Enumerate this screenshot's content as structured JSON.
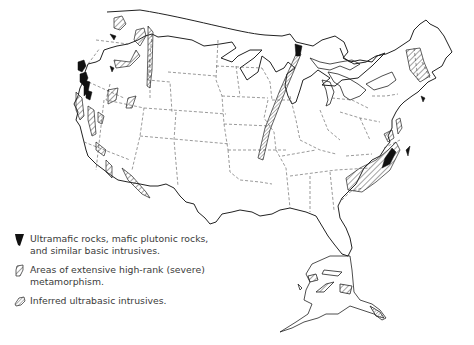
{
  "map": {
    "title": "Distribution of ultramafic rocks, high-rank metamorphism, and inferred ultrabasic intrusives in the United States",
    "region": "United States (conterminous) and Alaska",
    "colors": {
      "outline": "#222222",
      "state_border": "#555555",
      "solid_fill": "#111111",
      "hatch": "#333333",
      "background": "#ffffff"
    }
  },
  "legend": {
    "items": [
      {
        "symbol": "solid-black",
        "label": "Ultramafic rocks, mafic plutonic rocks, and similar basic intrusives."
      },
      {
        "symbol": "hatched-wide",
        "label": "Areas of extensive high-rank (severe) metamorphism."
      },
      {
        "symbol": "hatched-fine",
        "label": "Inferred ultrabasic intrusives."
      }
    ]
  }
}
